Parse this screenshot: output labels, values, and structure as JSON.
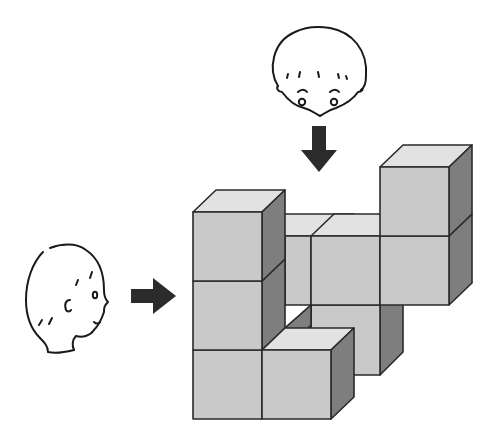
{
  "figure": {
    "colors": {
      "front_face": "#c9c9c9",
      "top_face": "#e2e2e2",
      "side_face": "#7e7e7e",
      "outline": "#2a2a2a",
      "arrow": "#2b2b2b",
      "background": "#ffffff"
    },
    "observers": [
      {
        "id": "top-observer",
        "view": "from above",
        "arrow_direction": "down"
      },
      {
        "id": "side-observer",
        "view": "from the left",
        "arrow_direction": "right"
      }
    ],
    "cube_size_px": 69,
    "visible_cube_count": 10
  }
}
